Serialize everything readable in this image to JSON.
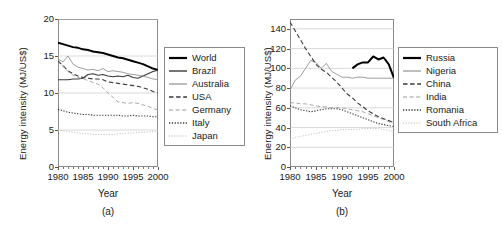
{
  "figure": {
    "panels": [
      "a",
      "b"
    ]
  },
  "chart_data": [
    {
      "type": "line",
      "panel_label": "(a)",
      "title": "",
      "xlabel": "Year",
      "ylabel": "Energy intensity (MJ/US$)",
      "xlim": [
        1980,
        2000
      ],
      "ylim": [
        0,
        20
      ],
      "xticks": [
        1980,
        1985,
        1990,
        1995,
        2000
      ],
      "yticks": [
        0,
        5,
        10,
        15,
        20
      ],
      "grid": "horizontal",
      "legend_position": "right-outside",
      "x": [
        1980,
        1981,
        1982,
        1983,
        1984,
        1985,
        1986,
        1987,
        1988,
        1989,
        1990,
        1991,
        1992,
        1993,
        1994,
        1995,
        1996,
        1997,
        1998,
        1999,
        2000
      ],
      "series": [
        {
          "name": "World",
          "style": "solid",
          "width": "thick",
          "color": "#000000",
          "values": [
            16.8,
            16.6,
            16.4,
            16.2,
            16.1,
            15.9,
            15.8,
            15.6,
            15.5,
            15.4,
            15.2,
            15.0,
            14.8,
            14.7,
            14.5,
            14.3,
            14.1,
            13.9,
            13.6,
            13.3,
            13.1
          ]
        },
        {
          "name": "Brazil",
          "style": "solid",
          "width": "medium",
          "color": "#3a3a3a",
          "values": [
            11.8,
            11.8,
            11.8,
            11.9,
            11.9,
            12.0,
            12.5,
            12.6,
            12.4,
            12.5,
            12.3,
            12.2,
            12.3,
            12.2,
            12.4,
            12.1,
            12.0,
            12.3,
            12.6,
            12.9,
            13.1
          ]
        },
        {
          "name": "Australia",
          "style": "solid",
          "width": "thin",
          "color": "#8c8c8c",
          "values": [
            14.6,
            14.2,
            15.0,
            13.9,
            13.5,
            13.3,
            13.1,
            13.2,
            13.0,
            13.3,
            12.9,
            13.0,
            12.9,
            12.8,
            12.6,
            12.5,
            12.4,
            12.3,
            12.1,
            11.9,
            11.8
          ]
        },
        {
          "name": "USA",
          "style": "dashed",
          "width": "medium",
          "color": "#3a3a3a",
          "values": [
            14.3,
            13.7,
            13.0,
            12.6,
            12.3,
            12.1,
            12.0,
            11.9,
            11.9,
            11.8,
            11.5,
            11.4,
            11.3,
            11.2,
            11.1,
            11.0,
            10.9,
            10.7,
            10.5,
            10.2,
            10.0
          ]
        },
        {
          "name": "Germany",
          "style": "dashed",
          "width": "thin",
          "color": "#9a9a9a",
          "values": [
            14.5,
            13.6,
            12.9,
            12.4,
            12.1,
            11.9,
            11.7,
            11.4,
            11.2,
            10.7,
            10.0,
            9.4,
            8.8,
            8.7,
            8.6,
            8.7,
            8.6,
            8.4,
            8.2,
            7.9,
            7.7
          ]
        },
        {
          "name": "Italy",
          "style": "dotted",
          "width": "medium",
          "color": "#3a3a3a",
          "values": [
            7.8,
            7.6,
            7.4,
            7.3,
            7.2,
            7.1,
            7.1,
            7.0,
            7.0,
            7.0,
            7.0,
            7.0,
            7.0,
            6.9,
            6.9,
            7.0,
            6.9,
            6.9,
            6.9,
            6.8,
            6.8
          ]
        },
        {
          "name": "Japan",
          "style": "dotted",
          "width": "thin",
          "color": "#b5b5b5",
          "values": [
            5.0,
            4.9,
            4.8,
            4.7,
            4.6,
            4.5,
            4.5,
            4.4,
            4.4,
            4.4,
            4.4,
            4.4,
            4.5,
            4.5,
            4.6,
            4.6,
            4.7,
            4.7,
            4.7,
            4.8,
            4.8
          ]
        }
      ]
    },
    {
      "type": "line",
      "panel_label": "(b)",
      "title": "",
      "xlabel": "Year",
      "ylabel": "Energy intensity (MJ/US$)",
      "xlim": [
        1980,
        2000
      ],
      "ylim": [
        0,
        150
      ],
      "xticks": [
        1980,
        1985,
        1990,
        1995,
        2000
      ],
      "yticks": [
        0,
        20,
        40,
        60,
        80,
        100,
        120,
        140
      ],
      "grid": "horizontal",
      "legend_position": "right-outside",
      "x": [
        1980,
        1981,
        1982,
        1983,
        1984,
        1985,
        1986,
        1987,
        1988,
        1989,
        1990,
        1991,
        1992,
        1993,
        1994,
        1995,
        1996,
        1997,
        1998,
        1999,
        2000
      ],
      "series": [
        {
          "name": "Russia",
          "style": "solid",
          "width": "thick",
          "color": "#000000",
          "x_start": 1992,
          "values": [
            null,
            null,
            null,
            null,
            null,
            null,
            null,
            null,
            null,
            null,
            null,
            null,
            100,
            104,
            106,
            106,
            112,
            109,
            111,
            104,
            90
          ]
        },
        {
          "name": "Nigeria",
          "style": "solid",
          "width": "thin",
          "color": "#8c8c8c",
          "values": [
            78,
            88,
            92,
            100,
            108,
            106,
            100,
            105,
            97,
            94,
            91,
            91,
            90,
            91,
            91,
            90,
            90,
            90,
            90,
            90,
            90
          ]
        },
        {
          "name": "China",
          "style": "dashed",
          "width": "medium",
          "color": "#3a3a3a",
          "values": [
            147,
            138,
            129,
            120,
            112,
            104,
            99,
            96,
            91,
            86,
            80,
            74,
            70,
            65,
            61,
            57,
            54,
            51,
            49,
            47,
            45
          ]
        },
        {
          "name": "India",
          "style": "dashed",
          "width": "thin",
          "color": "#9a9a9a",
          "values": [
            65,
            65,
            64,
            64,
            63,
            62,
            61,
            61,
            60,
            60,
            60,
            59,
            58,
            57,
            56,
            54,
            52,
            50,
            48,
            46,
            44
          ]
        },
        {
          "name": "Romania",
          "style": "dotted",
          "width": "medium",
          "color": "#3a3a3a",
          "values": [
            62,
            60,
            58,
            57,
            56,
            57,
            58,
            59,
            59,
            59,
            58,
            56,
            54,
            52,
            50,
            48,
            46,
            44,
            43,
            42,
            41
          ]
        },
        {
          "name": "South Africa",
          "style": "dotted",
          "width": "thin",
          "color": "#b5b5b5",
          "values": [
            28,
            30,
            31,
            32,
            33,
            34,
            35,
            36,
            37,
            37,
            38,
            38,
            38,
            38,
            39,
            39,
            39,
            39,
            38,
            37,
            36
          ]
        }
      ]
    }
  ]
}
